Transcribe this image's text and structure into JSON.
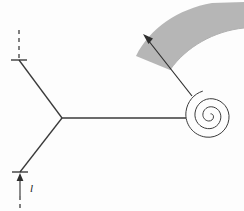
{
  "figure": {
    "background_color": "#fdfdfd",
    "stroke_color": "#3a3a3a",
    "band_fill_color": "#b0b0b0",
    "labels": {
      "length_label": "l"
    },
    "elements": {
      "junction_node": "y-junction",
      "upper_arm": "upper-left-arm",
      "lower_arm": "lower-left-arm",
      "horizontal_arm": "horizontal-feed-line",
      "spiral": "archimedean-spiral",
      "spiral_turns": "2.5",
      "radiation_band": "shaded-arc-band",
      "direction_arrow": "radiation-direction-arrow",
      "upper_dashed": "upper-dashed-reference-line",
      "lower_dashed": "lower-dashed-reference-line",
      "upper_tick": "upper-tick-mark",
      "lower_tick": "lower-tick-mark",
      "dimension_arrow": "length-dimension-arrow"
    },
    "geometry": {
      "junction": {
        "x": 62,
        "y": 118
      },
      "upper_tick": {
        "x": 19,
        "y": 60
      },
      "lower_tick": {
        "x": 20,
        "y": 172
      },
      "spiral_center": {
        "x": 210,
        "y": 115
      },
      "spiral_outer_radius": 27,
      "feed_entry": {
        "x": 185,
        "y": 118
      },
      "arrow_start": {
        "x": 192,
        "y": 96
      },
      "arrow_end": {
        "x": 144,
        "y": 36
      }
    }
  }
}
